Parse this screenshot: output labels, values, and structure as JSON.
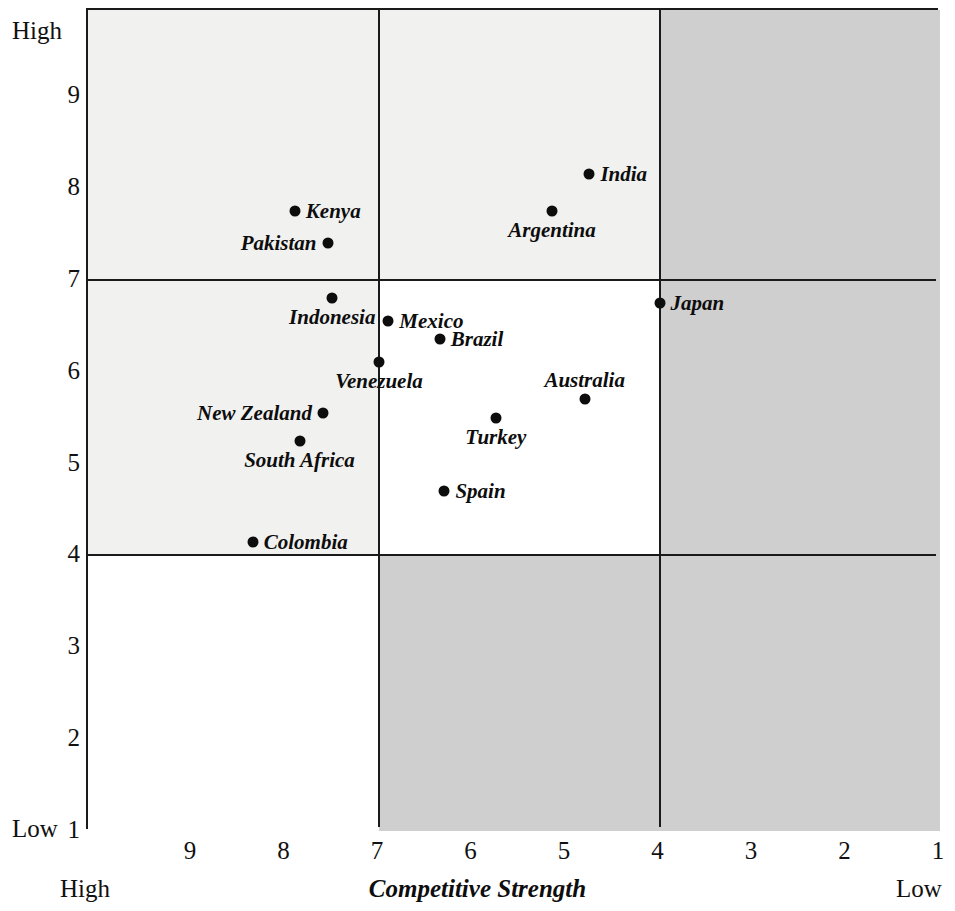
{
  "chart_data": {
    "type": "scatter",
    "title": "",
    "xlabel": "Competitive Strength",
    "ylabel": "",
    "xlim": [
      10,
      1
    ],
    "ylim": [
      1,
      10
    ],
    "x_axis_reversed": true,
    "grid": true,
    "legend": "none",
    "x_ticks": [
      "9",
      "8",
      "7",
      "6",
      "5",
      "4",
      "3",
      "2",
      "1"
    ],
    "y_ticks": [
      "9",
      "8",
      "7",
      "6",
      "5",
      "4",
      "3",
      "2",
      "1"
    ],
    "x_end_labels": {
      "left": "High",
      "right": "Low"
    },
    "y_end_labels": {
      "top": "High",
      "bottom": "Low"
    },
    "gridlines": {
      "vertical": [
        7,
        4
      ],
      "horizontal": [
        7,
        4
      ]
    },
    "points": [
      {
        "label": "India",
        "x": 4.75,
        "y": 8.15,
        "label_pos": "right"
      },
      {
        "label": "Kenya",
        "x": 7.9,
        "y": 7.75,
        "label_pos": "right"
      },
      {
        "label": "Argentina",
        "x": 5.15,
        "y": 7.75,
        "label_pos": "below"
      },
      {
        "label": "Pakistan",
        "x": 7.55,
        "y": 7.4,
        "label_pos": "left"
      },
      {
        "label": "Japan",
        "x": 4.0,
        "y": 6.75,
        "label_pos": "right"
      },
      {
        "label": "Indonesia",
        "x": 7.5,
        "y": 6.8,
        "label_pos": "below"
      },
      {
        "label": "Mexico",
        "x": 6.9,
        "y": 6.55,
        "label_pos": "right"
      },
      {
        "label": "Brazil",
        "x": 6.35,
        "y": 6.35,
        "label_pos": "right"
      },
      {
        "label": "Venezuela",
        "x": 7.0,
        "y": 6.1,
        "label_pos": "below"
      },
      {
        "label": "Australia",
        "x": 4.8,
        "y": 5.7,
        "label_pos": "above"
      },
      {
        "label": "New Zealand",
        "x": 7.6,
        "y": 5.55,
        "label_pos": "left"
      },
      {
        "label": "Turkey",
        "x": 5.75,
        "y": 5.5,
        "label_pos": "below"
      },
      {
        "label": "South Africa",
        "x": 7.85,
        "y": 5.25,
        "label_pos": "below"
      },
      {
        "label": "Spain",
        "x": 6.3,
        "y": 4.7,
        "label_pos": "right"
      },
      {
        "label": "Colombia",
        "x": 8.35,
        "y": 4.15,
        "label_pos": "right"
      }
    ],
    "quadrant_shading": [
      {
        "region": "top-left",
        "fill": "#f1f1f0"
      },
      {
        "region": "top-middle",
        "fill": "#f1f1f0"
      },
      {
        "region": "top-right",
        "fill": "#cfcfcf"
      },
      {
        "region": "mid-left",
        "fill": "#f1f1f0"
      },
      {
        "region": "mid-middle",
        "fill": "#ffffff"
      },
      {
        "region": "mid-right",
        "fill": "#cfcfcf"
      },
      {
        "region": "bottom-left",
        "fill": "#ffffff"
      },
      {
        "region": "bottom-middle",
        "fill": "#cfcfcf"
      },
      {
        "region": "bottom-right",
        "fill": "#cfcfcf"
      }
    ],
    "colors": {
      "point": "#0d0d0d",
      "axis": "#1a1a1a",
      "shade_light": "#f1f1f0",
      "shade_dark": "#cfcfcf",
      "background": "#ffffff"
    }
  }
}
